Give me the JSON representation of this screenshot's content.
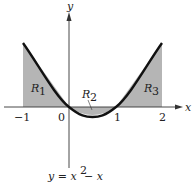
{
  "diagram": {
    "equation": "y = x² − x",
    "equation_parts": {
      "lhs": "y = x",
      "exp": "2",
      "rhs": " − x"
    },
    "axes": {
      "x_label": "x",
      "y_label": "y"
    },
    "x_ticks": [
      "−1",
      "0",
      "1",
      "2"
    ],
    "regions": [
      {
        "name": "R",
        "sub": "1"
      },
      {
        "name": "R",
        "sub": "2"
      },
      {
        "name": "R",
        "sub": "3"
      }
    ],
    "colors": {
      "shade": "#b5b5b5",
      "curve": "#111111",
      "axis": "#333333"
    }
  }
}
